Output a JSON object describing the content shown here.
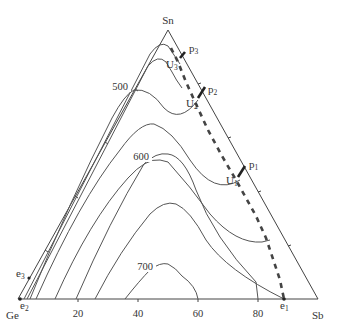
{
  "diagram": {
    "type": "ternary-liquidus-projection",
    "vertices": {
      "top": "Sn",
      "bottom_left": "Ge",
      "bottom_right": "Sb"
    },
    "base_axis_ticks": [
      "20",
      "40",
      "60",
      "80"
    ],
    "isotherm_labels": [
      "500",
      "600",
      "700"
    ],
    "invariant_points": {
      "p": [
        {
          "main": "p",
          "sub": "1"
        },
        {
          "main": "p",
          "sub": "2"
        },
        {
          "main": "p",
          "sub": "3"
        }
      ],
      "u": [
        {
          "main": "U",
          "sub": "1"
        },
        {
          "main": "U",
          "sub": "2"
        },
        {
          "main": "U",
          "sub": "3"
        }
      ],
      "e": [
        {
          "main": "e",
          "sub": "1"
        },
        {
          "main": "e",
          "sub": "2"
        },
        {
          "main": "e",
          "sub": "3"
        }
      ]
    },
    "colors": {
      "line": "#555555",
      "dashed_valley": "#444444",
      "text": "#333333"
    }
  }
}
